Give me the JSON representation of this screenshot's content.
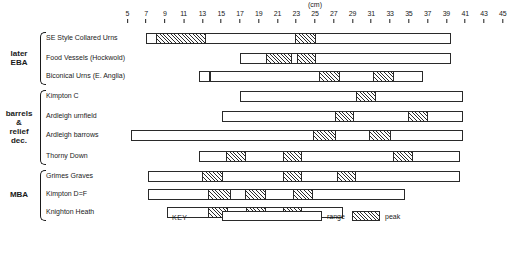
{
  "chart_data": {
    "type": "bar",
    "title": "",
    "xlabel": "(cm)",
    "ylabel": "",
    "xlim": [
      4,
      46
    ],
    "grid": false,
    "legend_position": "bottom-center",
    "axis": {
      "unit": "(cm)",
      "unit_at": 25,
      "ticks": [
        5,
        7,
        9,
        11,
        13,
        15,
        17,
        19,
        21,
        23,
        25,
        27,
        29,
        31,
        33,
        35,
        37,
        39,
        41,
        43,
        45
      ],
      "tick_labels": [
        "5",
        "7",
        "9",
        "11",
        "13",
        "15",
        "17",
        "19",
        "21",
        "23",
        "25",
        "27",
        "29",
        "31",
        "33",
        "35",
        "37",
        "39",
        "41",
        "43",
        "45"
      ]
    },
    "groups": [
      {
        "name": "later\nEBA",
        "rows": [
          {
            "label": "SE Style Collared Urns",
            "range": [
              7.0,
              39.5
            ],
            "peaks": [
              [
                8.0,
                13.3
              ],
              [
                22.8,
                25.0
              ]
            ]
          },
          {
            "label": "Food Vessels (Hockwold)",
            "range": [
              17.0,
              39.5
            ],
            "peaks": [
              [
                19.7,
                22.4
              ],
              [
                23.0,
                25.0
              ]
            ]
          },
          {
            "label": "Biconical Urns (E. Anglia)",
            "range": [
              12.6,
              36.5
            ],
            "peaks": [
              [
                13.6,
                13.7
              ],
              [
                25.3,
                27.6
              ],
              [
                31.1,
                33.3
              ]
            ]
          }
        ]
      },
      {
        "name": "barrels\n&\nrelief\ndec.",
        "rows": [
          {
            "label": "Kimpton C",
            "range": [
              17.0,
              40.8
            ],
            "peaks": [
              [
                29.3,
                31.4
              ]
            ]
          },
          {
            "label": "Ardleigh  urnfield",
            "range": [
              15.1,
              40.8
            ],
            "peaks": [
              [
                27.0,
                29.1
              ],
              [
                34.8,
                36.9
              ]
            ]
          },
          {
            "label": "Ardleigh  barrows",
            "range": [
              5.4,
              40.8
            ],
            "peaks": [
              [
                24.7,
                27.1
              ],
              [
                30.7,
                33.0
              ]
            ]
          },
          {
            "label": "Thorny Down",
            "range": [
              12.6,
              40.4
            ],
            "peaks": [
              [
                15.4,
                17.5
              ],
              [
                21.5,
                23.5
              ],
              [
                33.2,
                35.3
              ]
            ]
          }
        ]
      },
      {
        "name": "MBA",
        "rows": [
          {
            "label": "Grimes Graves",
            "range": [
              7.2,
              40.4
            ],
            "peaks": [
              [
                12.9,
                15.1
              ],
              [
                21.5,
                23.5
              ],
              [
                27.2,
                29.3
              ]
            ]
          },
          {
            "label": "Kimpton D=F",
            "range": [
              7.2,
              34.6
            ],
            "peaks": [
              [
                13.5,
                15.9
              ],
              [
                17.4,
                19.7
              ],
              [
                22.5,
                24.7
              ]
            ]
          },
          {
            "label": "Knighton Heath",
            "range": [
              9.2,
              28.0
            ],
            "peaks": [
              [
                13.5,
                15.6
              ],
              [
                17.5,
                19.7
              ],
              [
                21.5,
                23.5
              ]
            ]
          }
        ]
      }
    ],
    "key": {
      "title": "KEY",
      "entries": [
        {
          "label": "range",
          "style": "outline"
        },
        {
          "label": "peak",
          "style": "hatched"
        }
      ]
    },
    "colors": {
      "stroke": "#2a2a2a",
      "fill": "#ffffff",
      "hatch": "#2a2a2a",
      "background": "#ffffff"
    }
  }
}
